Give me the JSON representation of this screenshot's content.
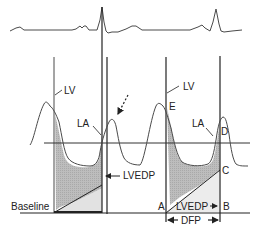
{
  "figure": {
    "labels": {
      "lv_left": "LV",
      "la_left": "LA",
      "lvedp_left": "LVEDP",
      "baseline": "Baseline",
      "lv_right": "LV",
      "la_right": "LA",
      "point_e": "E",
      "point_d": "D",
      "point_c": "C",
      "point_a": "A",
      "point_b": "B",
      "lvedp_right": "LVEDP",
      "dfp": "DFP"
    },
    "colors": {
      "line": "#4a4a4a",
      "dark_line": "#222222",
      "shade_dark": "#b8b8b8",
      "shade_light": "#e2e2e2"
    }
  }
}
